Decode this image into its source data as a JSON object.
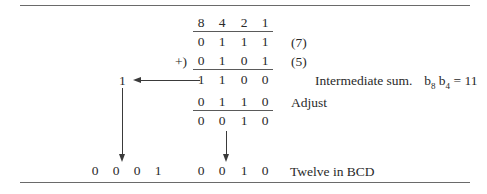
{
  "figure": {
    "caption_inline": "BCD addition example producing twelve",
    "rules": {
      "top_label": "top-border",
      "bottom_label": "bottom-border"
    }
  },
  "weights_row": {
    "label": "weights",
    "digits": [
      "8",
      "4",
      "2",
      "1"
    ]
  },
  "addend1_row": {
    "digits": [
      "0",
      "1",
      "1",
      "1"
    ],
    "annotation": "(7)"
  },
  "addend2_row": {
    "operator": "+)",
    "digits": [
      "0",
      "1",
      "0",
      "1"
    ],
    "annotation": "(5)"
  },
  "intermediate_row": {
    "carry": "1",
    "digits": [
      "1",
      "1",
      "0",
      "0"
    ],
    "annotation_prefix": "Intermediate sum.",
    "annotation_var1": "b",
    "annotation_var1_sub": "8",
    "annotation_var2": "b",
    "annotation_var2_sub": "4",
    "annotation_equals": "= 11"
  },
  "adjust_row": {
    "digits": [
      "0",
      "1",
      "1",
      "0"
    ],
    "annotation": "Adjust"
  },
  "result_row": {
    "digits": [
      "0",
      "0",
      "1",
      "0"
    ]
  },
  "final_row": {
    "tens_digits": [
      "0",
      "0",
      "0",
      "1"
    ],
    "units_digits": [
      "0",
      "0",
      "1",
      "0"
    ],
    "annotation": "Twelve in BCD"
  },
  "arrows": {
    "carry_left": "carry-left-arrow",
    "carry_down": "carry-down-arrow",
    "result_down": "result-down-arrow"
  },
  "colors": {
    "ink": "#2a2a2a",
    "rule": "#6a6a6a",
    "arrow": "#3a3a3a",
    "background": "#ffffff"
  }
}
